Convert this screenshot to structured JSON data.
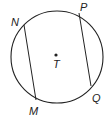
{
  "diagram": {
    "type": "circle-with-chords",
    "circle": {
      "center_label": "T",
      "cx": 57,
      "cy": 57,
      "r": 46
    },
    "points": [
      {
        "label": "N",
        "x": 24,
        "y": 25,
        "lx": 11,
        "ly": 26
      },
      {
        "label": "M",
        "x": 36,
        "y": 100,
        "lx": 29,
        "ly": 115
      },
      {
        "label": "P",
        "x": 79,
        "y": 13,
        "lx": 80,
        "ly": 11
      },
      {
        "label": "Q",
        "x": 91,
        "y": 86,
        "lx": 92,
        "ly": 102
      }
    ],
    "chords": [
      {
        "from": "N",
        "to": "M"
      },
      {
        "from": "P",
        "to": "Q"
      }
    ],
    "center": {
      "label": "T",
      "x": 56,
      "y": 55,
      "lx": 54,
      "ly": 68
    },
    "colors": {
      "stroke": "#222222",
      "background": "#ffffff"
    }
  }
}
